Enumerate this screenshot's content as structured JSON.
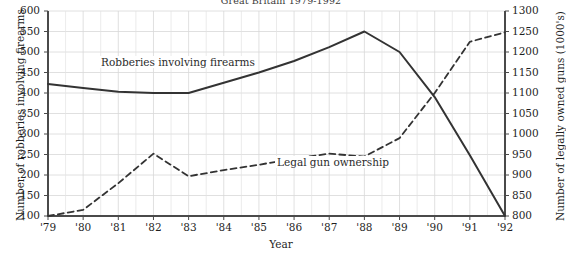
{
  "chart_data": {
    "type": "line",
    "title": "Great Britain 1979-1992",
    "xlabel": "Year",
    "ylabel": "Number of robberies involving firearms",
    "ylabel_right": "Number of legally owned guns (1000's)",
    "categories": [
      "'79",
      "'80",
      "'81",
      "'82",
      "'83",
      "'84",
      "'85",
      "'86",
      "'87",
      "'88",
      "'89",
      "'90",
      "'91",
      "'92"
    ],
    "x": [
      1979,
      1980,
      1981,
      1982,
      1983,
      1984,
      1985,
      1986,
      1987,
      1988,
      1989,
      1990,
      1991,
      1992
    ],
    "ylim": [
      100,
      600
    ],
    "yticks": [
      100,
      150,
      200,
      250,
      300,
      350,
      400,
      450,
      500,
      550,
      600
    ],
    "ylim_right": [
      800,
      1300
    ],
    "yticks_right": [
      800,
      850,
      900,
      950,
      1000,
      1050,
      1100,
      1150,
      1200,
      1250,
      1300
    ],
    "grid": true,
    "legend": "inline-labels",
    "series": [
      {
        "name": "Robberies involving firearms",
        "axis": "left",
        "style": "solid",
        "color": "#333333",
        "values": [
          422,
          412,
          403,
          400,
          400,
          425,
          450,
          478,
          512,
          550,
          500,
          390,
          248,
          100
        ]
      },
      {
        "name": "Legal gun ownership",
        "axis": "right",
        "style": "dashed",
        "color": "#333333",
        "values": [
          800,
          815,
          880,
          952,
          897,
          912,
          925,
          940,
          952,
          945,
          990,
          1100,
          1225,
          1248
        ]
      }
    ],
    "annotations": [
      {
        "text": "Robberies involving firearms",
        "series": "Robberies involving firearms"
      },
      {
        "text": "Legal gun ownership",
        "series": "Legal gun ownership"
      }
    ]
  }
}
